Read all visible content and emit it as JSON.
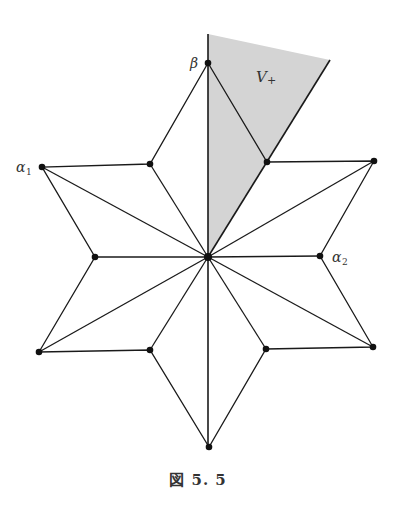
{
  "figure": {
    "caption": "図 5. 5",
    "shaded_region_label": "V",
    "shaded_region_subscript": "+",
    "shaded_color": "#d4d4d4",
    "labels": {
      "beta": "β",
      "alpha1_main": "α",
      "alpha1_sub": "1",
      "alpha2_main": "α",
      "alpha2_sub": "2"
    },
    "center": [
      208,
      257
    ],
    "outer_vertices": [
      [
        208,
        63
      ],
      [
        374,
        161
      ],
      [
        373,
        347
      ],
      [
        209,
        447
      ],
      [
        39,
        352
      ],
      [
        42,
        167
      ]
    ],
    "inner_vertices": [
      [
        267,
        162
      ],
      [
        320,
        256
      ],
      [
        266,
        349
      ],
      [
        150,
        350
      ],
      [
        95,
        257
      ],
      [
        150,
        164
      ]
    ]
  }
}
